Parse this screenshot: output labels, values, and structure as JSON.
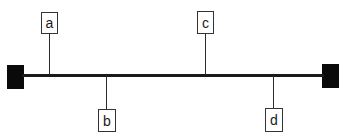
{
  "diagram": {
    "type": "bus-with-taps",
    "colors": {
      "line": "#1a1a1a",
      "terminal": "#0a0a0a",
      "box_border": "#333333",
      "background": "#ffffff"
    },
    "terminals": [
      {
        "id": "left-terminal",
        "x": 7,
        "y": 65,
        "w": 17,
        "h": 24
      },
      {
        "id": "right-terminal",
        "x": 322,
        "y": 64,
        "w": 17,
        "h": 24
      }
    ],
    "bus": {
      "x1": 24,
      "x2": 322,
      "y": 74
    },
    "taps": [
      {
        "label": "a",
        "side": "above",
        "x": 49
      },
      {
        "label": "b",
        "side": "below",
        "x": 106
      },
      {
        "label": "c",
        "side": "above",
        "x": 205
      },
      {
        "label": "d",
        "side": "below",
        "x": 273
      }
    ]
  }
}
